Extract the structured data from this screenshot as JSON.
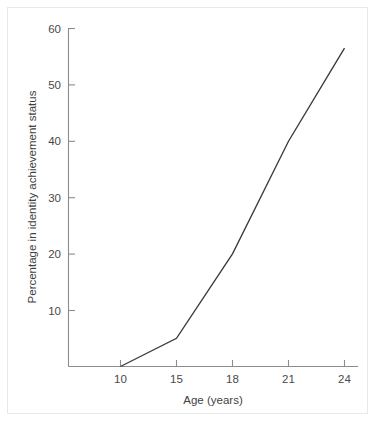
{
  "figure": {
    "background_color": "#ffffff",
    "border_color": "#e9e9e9",
    "line_color": "#3a3a3a",
    "axis_color": "#8c8c8c",
    "text_color": "#4a4a4a"
  },
  "chart_data": {
    "type": "line",
    "title": "",
    "subtitle": "",
    "xlabel": "Age (years)",
    "ylabel": "Percentage in identity achievement status",
    "categories": [
      "10",
      "15",
      "18",
      "21",
      "24"
    ],
    "x": [
      10,
      15,
      18,
      21,
      24
    ],
    "values": [
      0,
      5,
      20,
      40,
      56.5
    ],
    "series": [
      {
        "name": "Identity achievement",
        "values": [
          0,
          5,
          20,
          40,
          56.5
        ]
      }
    ],
    "x_tick_labels": [
      "10",
      "15",
      "18",
      "21",
      "24"
    ],
    "y_tick_labels": [
      "10",
      "20",
      "30",
      "40",
      "50",
      "60"
    ],
    "y_ticks": [
      10,
      20,
      30,
      40,
      50,
      60
    ],
    "ylim": [
      0,
      60
    ],
    "xlim_categorical": true,
    "x_spacing": "even",
    "grid": false,
    "legend": "none",
    "markers": false,
    "annotations": []
  }
}
